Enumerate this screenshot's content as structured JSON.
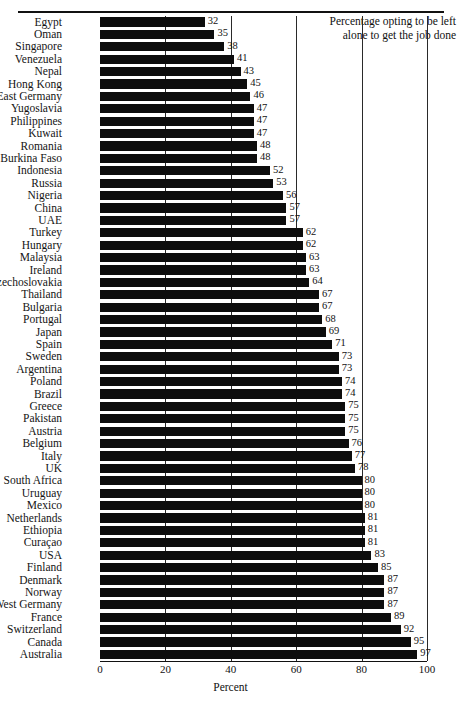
{
  "chart_data": {
    "type": "bar",
    "orientation": "horizontal",
    "title": "",
    "xlabel": "Percent",
    "ylabel": "",
    "xlim": [
      0,
      100
    ],
    "xticks": [
      0,
      20,
      40,
      60,
      80,
      100
    ],
    "grid": true,
    "legend": "none",
    "annotation": [
      "Percentage opting to be left",
      "alone to get the job done"
    ],
    "bar_color": "#0d0d0d",
    "categories": [
      "Egypt",
      "Oman",
      "Singapore",
      "Venezuela",
      "Nepal",
      "Hong Kong",
      "East Germany",
      "Yugoslavia",
      "Philippines",
      "Kuwait",
      "Romania",
      "Burkina Faso",
      "Indonesia",
      "Russia",
      "Nigeria",
      "China",
      "UAE",
      "Turkey",
      "Hungary",
      "Malaysia",
      "Ireland",
      "Czechoslovakia",
      "Thailand",
      "Bulgaria",
      "Portugal",
      "Japan",
      "Spain",
      "Sweden",
      "Argentina",
      "Poland",
      "Brazil",
      "Greece",
      "Pakistan",
      "Austria",
      "Belgium",
      "Italy",
      "UK",
      "South Africa",
      "Uruguay",
      "Mexico",
      "Netherlands",
      "Ethiopia",
      "Curaçao",
      "USA",
      "Finland",
      "Denmark",
      "Norway",
      "West Germany",
      "France",
      "Switzerland",
      "Canada",
      "Australia"
    ],
    "values": [
      32,
      35,
      38,
      41,
      43,
      45,
      46,
      47,
      47,
      47,
      48,
      48,
      52,
      53,
      56,
      57,
      57,
      62,
      62,
      63,
      63,
      64,
      67,
      67,
      68,
      69,
      71,
      73,
      73,
      74,
      74,
      75,
      75,
      75,
      76,
      77,
      78,
      80,
      80,
      80,
      81,
      81,
      81,
      83,
      85,
      87,
      87,
      87,
      89,
      92,
      95,
      97
    ]
  }
}
